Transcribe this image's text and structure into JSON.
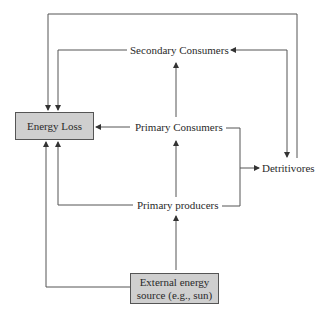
{
  "diagram": {
    "type": "energy-flow",
    "nodes": {
      "energy_loss": "Energy Loss",
      "secondary_consumers": "Secondary Consumers",
      "primary_consumers": "Primary Consumers",
      "primary_producers": "Primary producers",
      "detritivores": "Detritivores",
      "external_source_line1": "External energy",
      "external_source_line2": "source (e.g., sun)"
    },
    "edges": [
      {
        "from": "External energy source (e.g., sun)",
        "to": "Primary producers"
      },
      {
        "from": "External energy source (e.g., sun)",
        "to": "Energy Loss"
      },
      {
        "from": "Primary producers",
        "to": "Primary Consumers"
      },
      {
        "from": "Primary producers",
        "to": "Energy Loss"
      },
      {
        "from": "Primary producers",
        "to": "Detritivores"
      },
      {
        "from": "Primary Consumers",
        "to": "Secondary Consumers"
      },
      {
        "from": "Primary Consumers",
        "to": "Energy Loss"
      },
      {
        "from": "Primary Consumers",
        "to": "Detritivores"
      },
      {
        "from": "Secondary Consumers",
        "to": "Energy Loss"
      },
      {
        "from": "Secondary Consumers",
        "to": "Detritivores"
      },
      {
        "from": "Detritivores",
        "to": "Secondary Consumers"
      },
      {
        "from": "Detritivores",
        "to": "Energy Loss"
      }
    ],
    "colors": {
      "box_fill": "#cfcfcf",
      "line": "#444444",
      "background": "#ffffff"
    }
  }
}
